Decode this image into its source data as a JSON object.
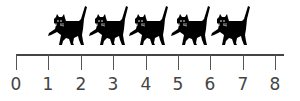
{
  "figure": {
    "axis": {
      "min": 0,
      "max": 8,
      "tick_labels": [
        "0",
        "1",
        "2",
        "3",
        "4",
        "5",
        "6",
        "7",
        "8"
      ],
      "line_color": "#444444",
      "label_color": "#444444"
    },
    "objects": {
      "icon": "cat-icon",
      "count": 5,
      "color": "#000000",
      "positions_x": [
        47,
        88,
        128,
        170,
        210
      ]
    }
  }
}
